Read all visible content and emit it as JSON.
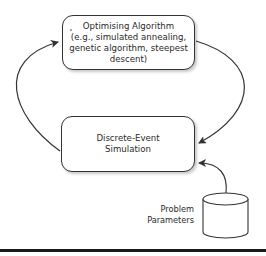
{
  "diagram": {
    "nodes": {
      "optimiser": {
        "title": "Optimising Algorithm",
        "lines": [
          "(e.g., simulated annealing,",
          "genetic algorithm, steepest",
          "descent)"
        ]
      },
      "simulation": {
        "lines": [
          "Discrete-Event",
          "Simulation"
        ]
      },
      "params": {
        "lines": [
          "Problem",
          "Parameters"
        ],
        "shape": "cylinder"
      }
    },
    "edges": [
      {
        "from": "simulation",
        "to": "optimiser",
        "side": "left"
      },
      {
        "from": "optimiser",
        "to": "simulation",
        "side": "right"
      },
      {
        "from": "params",
        "to": "simulation",
        "side": "right-bottom"
      }
    ],
    "colors": {
      "stroke": "#333333",
      "text": "#2a2a2a",
      "rule": "#1b1b1b"
    }
  }
}
